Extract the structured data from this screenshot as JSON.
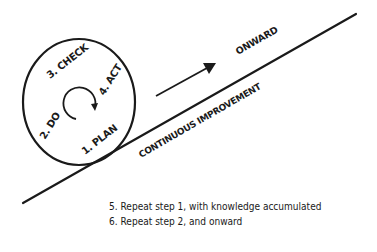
{
  "diagram": {
    "cycle_steps": [
      {
        "label": "1. PLAN"
      },
      {
        "label": "2. DO"
      },
      {
        "label": "3. CHECK"
      },
      {
        "label": "4. ACT"
      }
    ],
    "slope_label": "CONTINUOUS IMPROVEMENT",
    "direction_label": "ONWARD",
    "notes": [
      "5. Repeat step 1, with knowledge accumulated",
      "6. Repeat step 2, and onward"
    ],
    "colors": {
      "ink": "#1a1a1a",
      "background": "#ffffff"
    }
  }
}
